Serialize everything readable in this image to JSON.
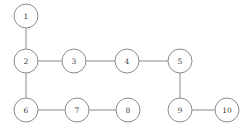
{
  "diagram": {
    "type": "undirected-graph",
    "title": "",
    "canvas": {
      "width": 247,
      "height": 130,
      "background": "#ffffff"
    },
    "style": {
      "node_fill": "#ffffff",
      "node_stroke": "#8a8a8a",
      "edge_stroke": "#8a8a8a",
      "label_color": "#3a3a3a",
      "node_radius": 12,
      "stroke_width": 1
    },
    "nodes": [
      {
        "id": "1",
        "label": "1",
        "cx": 26,
        "cy": 16
      },
      {
        "id": "2",
        "label": "2",
        "cx": 26,
        "cy": 61
      },
      {
        "id": "3",
        "label": "3",
        "cx": 74,
        "cy": 61
      },
      {
        "id": "4",
        "label": "4",
        "cx": 127,
        "cy": 61
      },
      {
        "id": "5",
        "label": "5",
        "cx": 180,
        "cy": 61
      },
      {
        "id": "6",
        "label": "6",
        "cx": 26,
        "cy": 110
      },
      {
        "id": "7",
        "label": "7",
        "cx": 77,
        "cy": 110
      },
      {
        "id": "8",
        "label": "8",
        "cx": 128,
        "cy": 110
      },
      {
        "id": "9",
        "label": "9",
        "cx": 180,
        "cy": 110
      },
      {
        "id": "10",
        "label": "10",
        "cx": 227,
        "cy": 110
      }
    ],
    "edges": [
      {
        "source": "1",
        "target": "2",
        "x1": 26,
        "y1": 28,
        "x2": 26,
        "y2": 49
      },
      {
        "source": "2",
        "target": "3",
        "x1": 38,
        "y1": 61,
        "x2": 62,
        "y2": 61
      },
      {
        "source": "3",
        "target": "4",
        "x1": 86,
        "y1": 61,
        "x2": 115,
        "y2": 61
      },
      {
        "source": "4",
        "target": "5",
        "x1": 139,
        "y1": 61,
        "x2": 168,
        "y2": 61
      },
      {
        "source": "2",
        "target": "6",
        "x1": 26,
        "y1": 73,
        "x2": 26,
        "y2": 98
      },
      {
        "source": "5",
        "target": "9",
        "x1": 180,
        "y1": 73,
        "x2": 180,
        "y2": 98
      },
      {
        "source": "6",
        "target": "7",
        "x1": 38,
        "y1": 110,
        "x2": 65,
        "y2": 110
      },
      {
        "source": "7",
        "target": "8",
        "x1": 89,
        "y1": 110,
        "x2": 116,
        "y2": 110
      },
      {
        "source": "9",
        "target": "10",
        "x1": 192,
        "y1": 110,
        "x2": 215,
        "y2": 110
      }
    ]
  }
}
